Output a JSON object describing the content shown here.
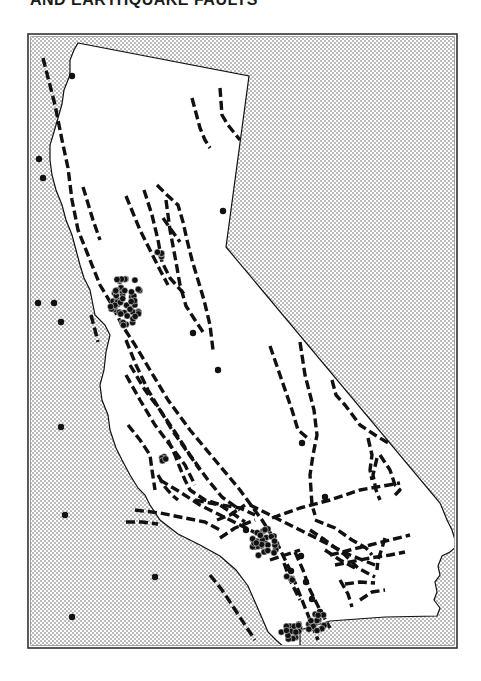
{
  "title": "AND EARTHQUAKE FAULTS",
  "colors": {
    "ink": "#111111",
    "frame": "#333333",
    "ocean_dot": "#555555",
    "land": "#ffffff",
    "background": "#ffffff"
  },
  "frame": {
    "x": 28,
    "y": 34,
    "w": 429,
    "h": 614
  },
  "legend_semantics": {
    "dashed_lines": "earthquake faults",
    "dots": "earthquake epicenters",
    "stippled_area": "Pacific Ocean"
  },
  "state_outline": [
    [
      78,
      43
    ],
    [
      249,
      76
    ],
    [
      226,
      247
    ],
    [
      440,
      503
    ],
    [
      443,
      510
    ],
    [
      447,
      520
    ],
    [
      452,
      530
    ],
    [
      455,
      540
    ],
    [
      458,
      545
    ],
    [
      450,
      552
    ],
    [
      442,
      556
    ],
    [
      438,
      566
    ],
    [
      440,
      575
    ],
    [
      435,
      582
    ],
    [
      437,
      592
    ],
    [
      434,
      600
    ],
    [
      440,
      608
    ],
    [
      437,
      616
    ],
    [
      385,
      617
    ],
    [
      330,
      621
    ],
    [
      300,
      630
    ],
    [
      300,
      648
    ],
    [
      285,
      648
    ],
    [
      276,
      640
    ],
    [
      268,
      632
    ],
    [
      262,
      618
    ],
    [
      255,
      602
    ],
    [
      248,
      586
    ],
    [
      236,
      570
    ],
    [
      220,
      556
    ],
    [
      200,
      545
    ],
    [
      178,
      534
    ],
    [
      160,
      520
    ],
    [
      150,
      505
    ],
    [
      145,
      495
    ],
    [
      138,
      488
    ],
    [
      130,
      475
    ],
    [
      122,
      460
    ],
    [
      116,
      448
    ],
    [
      110,
      430
    ],
    [
      108,
      415
    ],
    [
      102,
      400
    ],
    [
      100,
      385
    ],
    [
      104,
      370
    ],
    [
      106,
      352
    ],
    [
      110,
      335
    ],
    [
      105,
      325
    ],
    [
      95,
      315
    ],
    [
      92,
      300
    ],
    [
      90,
      290
    ],
    [
      84,
      278
    ],
    [
      80,
      265
    ],
    [
      76,
      250
    ],
    [
      72,
      235
    ],
    [
      66,
      220
    ],
    [
      62,
      205
    ],
    [
      56,
      190
    ],
    [
      52,
      175
    ],
    [
      50,
      160
    ],
    [
      50,
      145
    ],
    [
      54,
      132
    ],
    [
      58,
      118
    ],
    [
      62,
      104
    ],
    [
      64,
      90
    ],
    [
      70,
      75
    ],
    [
      70,
      60
    ],
    [
      74,
      50
    ],
    [
      78,
      43
    ]
  ],
  "faults": [
    [
      [
        43,
        58
      ],
      [
        55,
        105
      ],
      [
        62,
        140
      ],
      [
        68,
        168
      ],
      [
        72,
        200
      ],
      [
        78,
        230
      ],
      [
        88,
        255
      ],
      [
        100,
        285
      ],
      [
        112,
        305
      ],
      [
        122,
        325
      ],
      [
        135,
        345
      ],
      [
        150,
        370
      ],
      [
        168,
        400
      ],
      [
        190,
        430
      ],
      [
        215,
        460
      ],
      [
        240,
        490
      ],
      [
        262,
        520
      ],
      [
        278,
        545
      ],
      [
        290,
        570
      ],
      [
        302,
        600
      ],
      [
        318,
        640
      ]
    ],
    [
      [
        192,
        98
      ],
      [
        200,
        128
      ],
      [
        205,
        140
      ],
      [
        210,
        148
      ]
    ],
    [
      [
        220,
        88
      ],
      [
        222,
        115
      ],
      [
        228,
        125
      ],
      [
        240,
        140
      ]
    ],
    [
      [
        83,
        187
      ],
      [
        93,
        220
      ],
      [
        100,
        240
      ]
    ],
    [
      [
        126,
        196
      ],
      [
        140,
        230
      ],
      [
        150,
        250
      ],
      [
        160,
        270
      ],
      [
        168,
        285
      ]
    ],
    [
      [
        144,
        190
      ],
      [
        152,
        215
      ],
      [
        158,
        240
      ],
      [
        162,
        262
      ],
      [
        170,
        278
      ],
      [
        186,
        296
      ]
    ],
    [
      [
        157,
        185
      ],
      [
        167,
        195
      ],
      [
        178,
        205
      ],
      [
        183,
        222
      ],
      [
        187,
        240
      ],
      [
        192,
        260
      ],
      [
        198,
        280
      ],
      [
        204,
        300
      ],
      [
        210,
        325
      ],
      [
        213,
        350
      ]
    ],
    [
      [
        166,
        200
      ],
      [
        170,
        230
      ],
      [
        176,
        262
      ],
      [
        180,
        285
      ],
      [
        186,
        306
      ],
      [
        195,
        320
      ],
      [
        205,
        335
      ]
    ],
    [
      [
        163,
        218
      ],
      [
        170,
        228
      ],
      [
        180,
        242
      ]
    ],
    [
      [
        91,
        315
      ],
      [
        95,
        330
      ],
      [
        98,
        342
      ]
    ],
    [
      [
        126,
        340
      ],
      [
        136,
        365
      ],
      [
        148,
        390
      ],
      [
        160,
        410
      ],
      [
        172,
        430
      ],
      [
        186,
        450
      ],
      [
        200,
        470
      ]
    ],
    [
      [
        130,
        365
      ],
      [
        145,
        390
      ],
      [
        160,
        410
      ],
      [
        175,
        432
      ],
      [
        190,
        455
      ],
      [
        208,
        480
      ],
      [
        222,
        497
      ],
      [
        240,
        510
      ]
    ],
    [
      [
        126,
        375
      ],
      [
        140,
        400
      ],
      [
        155,
        425
      ],
      [
        170,
        445
      ],
      [
        185,
        465
      ],
      [
        195,
        485
      ]
    ],
    [
      [
        168,
        440
      ],
      [
        175,
        455
      ],
      [
        180,
        468
      ],
      [
        185,
        480
      ],
      [
        190,
        490
      ],
      [
        205,
        500
      ],
      [
        222,
        505
      ],
      [
        240,
        508
      ],
      [
        255,
        515
      ]
    ],
    [
      [
        128,
        425
      ],
      [
        140,
        440
      ],
      [
        150,
        455
      ],
      [
        152,
        470
      ],
      [
        155,
        490
      ]
    ],
    [
      [
        158,
        475
      ],
      [
        165,
        487
      ],
      [
        172,
        495
      ],
      [
        178,
        500
      ]
    ],
    [
      [
        270,
        346
      ],
      [
        280,
        375
      ],
      [
        292,
        410
      ],
      [
        298,
        430
      ],
      [
        310,
        440
      ]
    ],
    [
      [
        300,
        342
      ],
      [
        305,
        375
      ],
      [
        314,
        410
      ],
      [
        317,
        435
      ],
      [
        313,
        455
      ],
      [
        310,
        475
      ],
      [
        312,
        505
      ],
      [
        315,
        515
      ]
    ],
    [
      [
        332,
        380
      ],
      [
        336,
        395
      ],
      [
        345,
        405
      ],
      [
        360,
        425
      ],
      [
        375,
        435
      ],
      [
        390,
        444
      ]
    ],
    [
      [
        368,
        438
      ],
      [
        372,
        455
      ],
      [
        370,
        470
      ],
      [
        372,
        480
      ]
    ],
    [
      [
        377,
        458
      ],
      [
        373,
        475
      ],
      [
        376,
        490
      ],
      [
        380,
        500
      ]
    ],
    [
      [
        380,
        455
      ],
      [
        390,
        470
      ],
      [
        395,
        485
      ],
      [
        400,
        490
      ],
      [
        395,
        495
      ]
    ],
    [
      [
        272,
        518
      ],
      [
        300,
        508
      ],
      [
        330,
        500
      ],
      [
        360,
        490
      ],
      [
        400,
        483
      ]
    ],
    [
      [
        250,
        505
      ],
      [
        270,
        515
      ],
      [
        290,
        525
      ],
      [
        310,
        535
      ],
      [
        330,
        545
      ],
      [
        350,
        555
      ],
      [
        375,
        565
      ]
    ],
    [
      [
        195,
        500
      ],
      [
        220,
        505
      ],
      [
        235,
        515
      ],
      [
        245,
        522
      ]
    ],
    [
      [
        135,
        510
      ],
      [
        160,
        513
      ],
      [
        185,
        518
      ],
      [
        205,
        522
      ],
      [
        220,
        530
      ]
    ],
    [
      [
        160,
        480
      ],
      [
        180,
        492
      ],
      [
        200,
        505
      ],
      [
        220,
        515
      ],
      [
        240,
        525
      ],
      [
        260,
        535
      ]
    ],
    [
      [
        217,
        520
      ],
      [
        230,
        515
      ],
      [
        245,
        505
      ]
    ],
    [
      [
        220,
        538
      ],
      [
        235,
        528
      ],
      [
        255,
        520
      ]
    ],
    [
      [
        315,
        520
      ],
      [
        335,
        528
      ],
      [
        352,
        540
      ],
      [
        366,
        548
      ],
      [
        372,
        555
      ]
    ],
    [
      [
        310,
        530
      ],
      [
        325,
        540
      ],
      [
        345,
        555
      ],
      [
        358,
        568
      ],
      [
        375,
        577
      ]
    ],
    [
      [
        325,
        550
      ],
      [
        340,
        560
      ],
      [
        355,
        568
      ]
    ],
    [
      [
        330,
        555
      ],
      [
        350,
        550
      ],
      [
        370,
        545
      ],
      [
        390,
        540
      ],
      [
        410,
        535
      ]
    ],
    [
      [
        335,
        565
      ],
      [
        350,
        562
      ],
      [
        370,
        558
      ],
      [
        390,
        555
      ],
      [
        405,
        552
      ]
    ],
    [
      [
        385,
        538
      ],
      [
        382,
        548
      ],
      [
        378,
        560
      ],
      [
        377,
        570
      ]
    ],
    [
      [
        295,
        552
      ],
      [
        303,
        570
      ],
      [
        310,
        590
      ],
      [
        320,
        610
      ],
      [
        330,
        628
      ]
    ],
    [
      [
        284,
        563
      ],
      [
        290,
        580
      ],
      [
        300,
        600
      ]
    ],
    [
      [
        270,
        560
      ],
      [
        285,
        555
      ],
      [
        300,
        550
      ]
    ],
    [
      [
        340,
        580
      ],
      [
        348,
        594
      ],
      [
        352,
        607
      ]
    ],
    [
      [
        345,
        584
      ],
      [
        360,
        582
      ],
      [
        375,
        583
      ]
    ],
    [
      [
        360,
        600
      ],
      [
        372,
        592
      ],
      [
        385,
        590
      ]
    ],
    [
      [
        210,
        575
      ],
      [
        222,
        590
      ],
      [
        232,
        605
      ],
      [
        245,
        625
      ],
      [
        255,
        640
      ]
    ],
    [
      [
        126,
        522
      ],
      [
        142,
        522
      ],
      [
        158,
        524
      ]
    ]
  ],
  "epicenters_single": [
    [
      72,
      76
    ],
    [
      39,
      159
    ],
    [
      43,
      178
    ],
    [
      38,
      303
    ],
    [
      54,
      303
    ],
    [
      61,
      322
    ],
    [
      223,
      211
    ],
    [
      193,
      333
    ],
    [
      218,
      370
    ],
    [
      61,
      427
    ],
    [
      302,
      443
    ],
    [
      325,
      497
    ],
    [
      246,
      530
    ],
    [
      65,
      515
    ],
    [
      155,
      577
    ],
    [
      72,
      617
    ],
    [
      301,
      556
    ],
    [
      291,
      571
    ],
    [
      306,
      582
    ],
    [
      312,
      599
    ],
    [
      320,
      612
    ]
  ],
  "epicenter_clusters": [
    {
      "name": "san-francisco-bay",
      "cx": 125,
      "cy": 300,
      "rx": 16,
      "ry": 26,
      "count": 55
    },
    {
      "name": "sacramento-valley",
      "cx": 161,
      "cy": 253,
      "rx": 4,
      "ry": 4,
      "count": 4
    },
    {
      "name": "santa-barbara-area",
      "cx": 163,
      "cy": 458,
      "rx": 5,
      "ry": 4,
      "count": 4
    },
    {
      "name": "los-angeles",
      "cx": 265,
      "cy": 543,
      "rx": 13,
      "ry": 15,
      "count": 32
    },
    {
      "name": "san-diego-coast",
      "cx": 292,
      "cy": 630,
      "rx": 11,
      "ry": 10,
      "count": 18
    },
    {
      "name": "border-east",
      "cx": 316,
      "cy": 622,
      "rx": 10,
      "ry": 11,
      "count": 16
    },
    {
      "name": "salton-area",
      "cx": 290,
      "cy": 578,
      "rx": 4,
      "ry": 3,
      "count": 3
    }
  ]
}
